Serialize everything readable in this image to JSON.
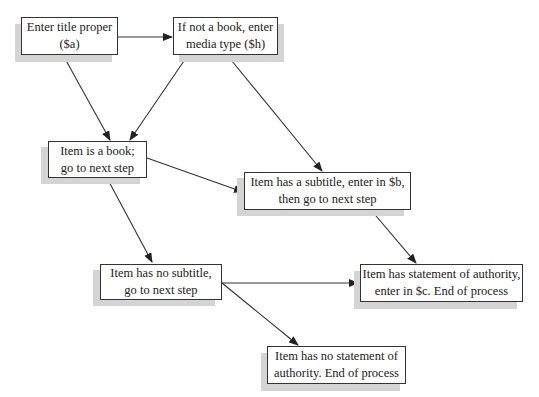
{
  "figure": {
    "title": "",
    "colors": {
      "border": "#333333",
      "shadow": "#d4d4d4",
      "arrow": "#333333",
      "background": "#ffffff"
    }
  },
  "nodes": [
    {
      "id": "n1",
      "line1": "Enter title proper",
      "line2": "($a)"
    },
    {
      "id": "n2",
      "line1": "If not a book, enter",
      "line2": "media type ($h)"
    },
    {
      "id": "n3",
      "line1": "Item is a book;",
      "line2": "go to next step"
    },
    {
      "id": "n4",
      "line1": "Item has a subtitle, enter in $b,",
      "line2": "then go to next step"
    },
    {
      "id": "n5",
      "line1": "Item has no subtitle,",
      "line2": "go to next step"
    },
    {
      "id": "n6",
      "line1": "Item has statement of authority,",
      "line2": "enter in $c. End of process"
    },
    {
      "id": "n7",
      "line1": "Item has no statement of",
      "line2": "authority. End of process"
    }
  ],
  "edges": [
    {
      "from": "n1",
      "to": "n2"
    },
    {
      "from": "n1",
      "to": "n3"
    },
    {
      "from": "n2",
      "to": "n3"
    },
    {
      "from": "n2",
      "to": "n4"
    },
    {
      "from": "n3",
      "to": "n4"
    },
    {
      "from": "n3",
      "to": "n5"
    },
    {
      "from": "n4",
      "to": "n6"
    },
    {
      "from": "n5",
      "to": "n6"
    },
    {
      "from": "n5",
      "to": "n7"
    }
  ]
}
